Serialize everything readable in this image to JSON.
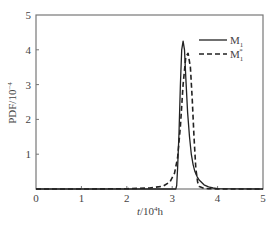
{
  "chart_data": {
    "type": "line",
    "title": "",
    "xlabel": "t/10^4h",
    "xlabel_parts": {
      "var": "t",
      "base": "/10",
      "exp": "4",
      "unit": "h"
    },
    "ylabel": "PDF/10^-4",
    "ylabel_parts": {
      "base": "PDF/10",
      "exp": "−4"
    },
    "xlim": [
      0,
      5
    ],
    "ylim": [
      0,
      5
    ],
    "xticks": [
      0,
      1,
      2,
      3,
      4,
      5
    ],
    "yticks": [
      1,
      2,
      3,
      4,
      5
    ],
    "ytick_zero_label": "0",
    "grid": false,
    "legend_position": "upper right",
    "series": [
      {
        "name": "M1",
        "label_base": "M",
        "label_sub": "1",
        "label_sup": "",
        "style": "solid",
        "x": [
          0,
          2.5,
          3.0,
          3.08,
          3.1,
          3.12,
          3.15,
          3.18,
          3.21,
          3.24,
          3.27,
          3.3,
          3.34,
          3.38,
          3.42,
          3.46,
          3.5,
          3.55,
          3.6,
          3.7,
          3.8,
          3.9,
          4.0,
          5.0
        ],
        "y": [
          0,
          0,
          0,
          0,
          0.1,
          0.6,
          1.6,
          3.0,
          4.0,
          4.25,
          4.0,
          3.2,
          2.2,
          1.5,
          1.0,
          0.7,
          0.5,
          0.35,
          0.25,
          0.12,
          0.06,
          0.03,
          0.01,
          0
        ]
      },
      {
        "name": "M1*",
        "label_base": "M",
        "label_sub": "1",
        "label_sup": "*",
        "style": "dashed",
        "x": [
          0,
          1.0,
          2.0,
          2.5,
          2.8,
          2.95,
          3.05,
          3.12,
          3.18,
          3.24,
          3.3,
          3.35,
          3.4,
          3.44,
          3.48,
          3.52,
          3.56,
          3.6,
          3.7,
          3.8,
          4.0,
          5.0
        ],
        "y": [
          0,
          0,
          0.01,
          0.03,
          0.08,
          0.2,
          0.45,
          0.9,
          1.8,
          3.0,
          3.8,
          3.9,
          3.5,
          2.6,
          1.5,
          0.6,
          0.2,
          0.07,
          0.02,
          0.01,
          0,
          0
        ]
      }
    ]
  },
  "colors": {
    "axis": "#777777",
    "line": "#222222",
    "text": "#444444",
    "background": "#ffffff"
  }
}
